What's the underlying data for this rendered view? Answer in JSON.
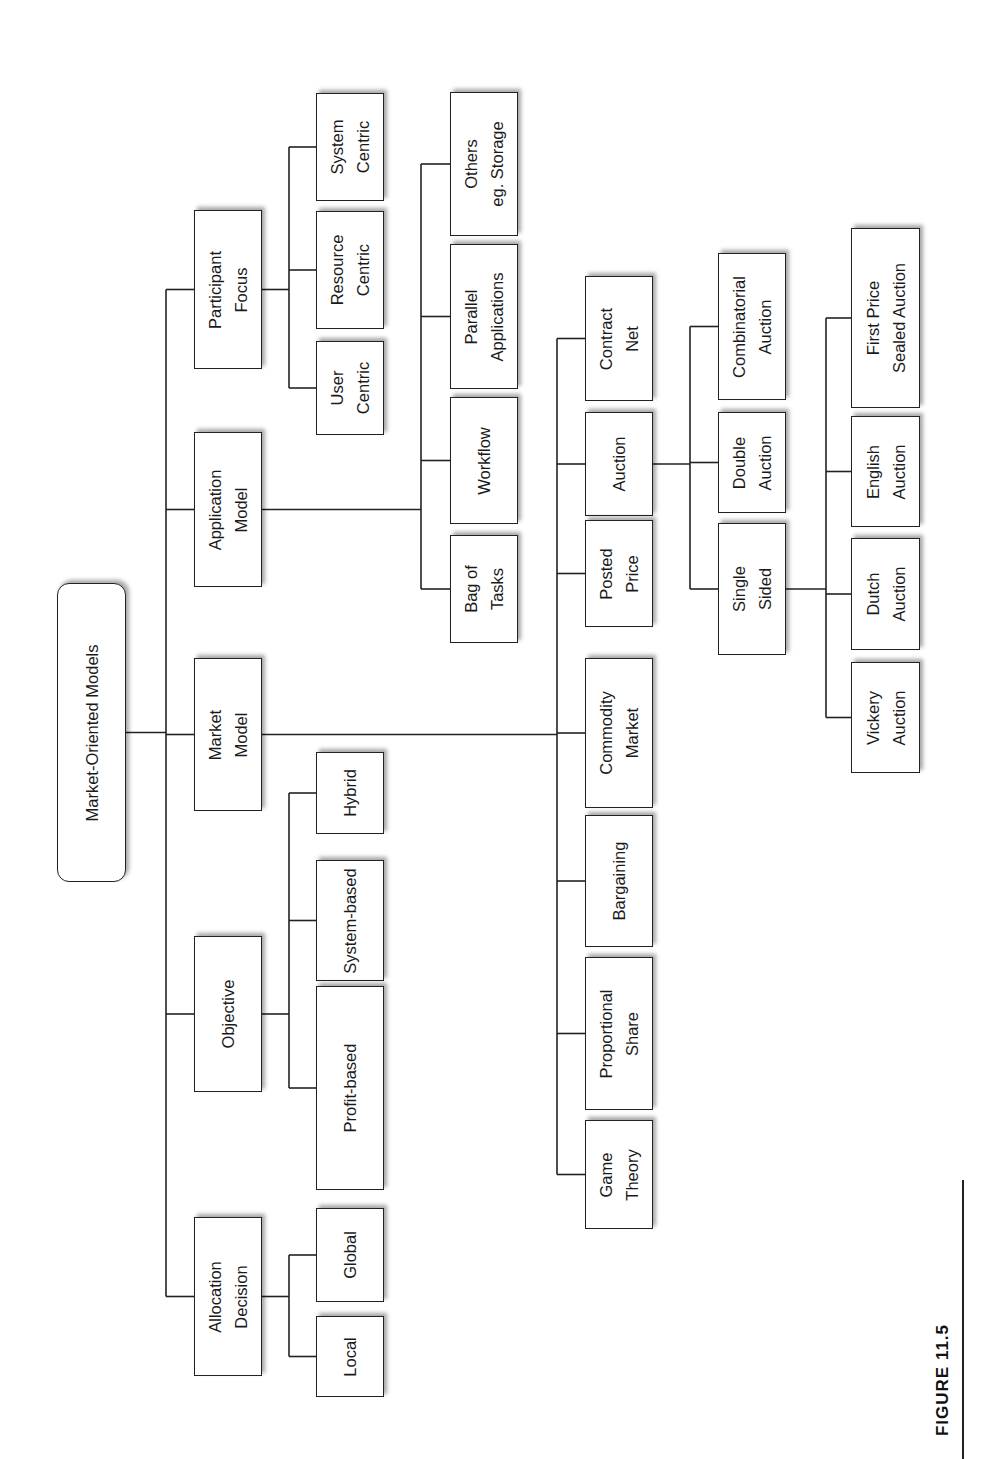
{
  "figure": {
    "label": "FIGURE 11.5",
    "orientation": "rotated 90 degrees counter-clockwise"
  },
  "tree": {
    "root": {
      "id": "root",
      "label": "Market-Oriented Models",
      "box": [
        57,
        583,
        126,
        882
      ]
    },
    "trunk_x": 166,
    "categories": [
      {
        "id": "participant-focus",
        "label": "Participant\nFocus",
        "box": [
          194,
          210,
          262,
          369
        ],
        "branch_x": 289,
        "children": [
          {
            "id": "system-centric",
            "label": "System\nCentric",
            "box": [
              316,
              93,
              384,
              201
            ]
          },
          {
            "id": "resource-centric",
            "label": "Resource\nCentric",
            "box": [
              316,
              211,
              384,
              329
            ]
          },
          {
            "id": "user-centric",
            "label": "User\nCentric",
            "box": [
              316,
              341,
              384,
              435
            ]
          }
        ]
      },
      {
        "id": "application-model",
        "label": "Application\nModel",
        "box": [
          194,
          432,
          262,
          587
        ],
        "branch_x": 421,
        "children": [
          {
            "id": "others-storage",
            "label": "Others\neg. Storage",
            "box": [
              450,
              92,
              518,
              236
            ]
          },
          {
            "id": "parallel-applications",
            "label": "Parallel\nApplications",
            "box": [
              450,
              244,
              518,
              389
            ]
          },
          {
            "id": "workflow",
            "label": "Workflow",
            "box": [
              450,
              397,
              518,
              524
            ]
          },
          {
            "id": "bag-of-tasks",
            "label": "Bag of\nTasks",
            "box": [
              450,
              535,
              518,
              643
            ]
          }
        ]
      },
      {
        "id": "market-model",
        "label": "Market\nModel",
        "box": [
          194,
          658,
          262,
          811
        ],
        "branch_x": 557,
        "children": [
          {
            "id": "contract-net",
            "label": "Contract\nNet",
            "box": [
              585,
              276,
              653,
              401
            ]
          },
          {
            "id": "auction",
            "label": "Auction",
            "box": [
              585,
              412,
              653,
              516
            ],
            "branch_x": 690,
            "children": [
              {
                "id": "combinatorial-auction",
                "label": "Combinatorial\nAuction",
                "box": [
                  718,
                  253,
                  786,
                  400
                ]
              },
              {
                "id": "double-auction",
                "label": "Double\nAuction",
                "box": [
                  718,
                  412,
                  786,
                  513
                ]
              },
              {
                "id": "single-sided",
                "label": "Single\nSided",
                "box": [
                  718,
                  523,
                  786,
                  655
                ],
                "branch_x": 826,
                "children": [
                  {
                    "id": "first-price-sealed-auction",
                    "label": "First Price\nSealed Auction",
                    "box": [
                      851,
                      228,
                      920,
                      408
                    ]
                  },
                  {
                    "id": "english-auction",
                    "label": "English\nAuction",
                    "box": [
                      851,
                      416,
                      920,
                      527
                    ]
                  },
                  {
                    "id": "dutch-auction",
                    "label": "Dutch\nAuction",
                    "box": [
                      851,
                      538,
                      920,
                      650
                    ]
                  },
                  {
                    "id": "vickery-auction",
                    "label": "Vickery\nAuction",
                    "box": [
                      851,
                      662,
                      920,
                      773
                    ]
                  }
                ]
              }
            ]
          },
          {
            "id": "posted-price",
            "label": "Posted\nPrice",
            "box": [
              585,
              520,
              653,
              627
            ]
          },
          {
            "id": "commodity-market",
            "label": "Commodity\nMarket",
            "box": [
              585,
              658,
              653,
              808
            ]
          },
          {
            "id": "bargaining",
            "label": "Bargaining",
            "box": [
              585,
              815,
              653,
              947
            ]
          },
          {
            "id": "proportional-share",
            "label": "Proportional\nShare",
            "box": [
              585,
              957,
              653,
              1110
            ]
          },
          {
            "id": "game-theory",
            "label": "Game\nTheory",
            "box": [
              585,
              1120,
              653,
              1229
            ]
          }
        ]
      },
      {
        "id": "objective",
        "label": "Objective",
        "box": [
          194,
          936,
          262,
          1092
        ],
        "branch_x": 289,
        "children": [
          {
            "id": "hybrid",
            "label": "Hybrid",
            "box": [
              316,
              752,
              384,
              834
            ]
          },
          {
            "id": "system-based",
            "label": "System-based",
            "box": [
              316,
              860,
              384,
              981
            ]
          },
          {
            "id": "profit-based",
            "label": "Profit-based",
            "box": [
              316,
              986,
              384,
              1190
            ]
          }
        ]
      },
      {
        "id": "allocation-decision",
        "label": "Allocation\nDecision",
        "box": [
          194,
          1217,
          262,
          1376
        ],
        "branch_x": 289,
        "children": [
          {
            "id": "global",
            "label": "Global",
            "box": [
              316,
              1208,
              384,
              1302
            ]
          },
          {
            "id": "local",
            "label": "Local",
            "box": [
              316,
              1316,
              384,
              1397
            ]
          }
        ]
      }
    ]
  }
}
